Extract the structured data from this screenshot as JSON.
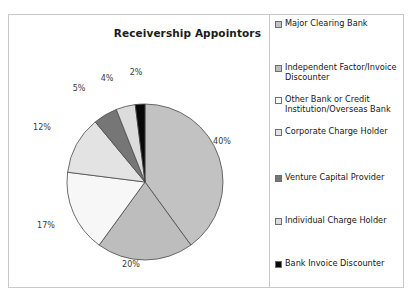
{
  "chart_data": {
    "type": "pie",
    "title": "Receivership Appointors",
    "categories": [
      "Major Clearing Bank",
      "Independent Factor/Invoice Discounter",
      "Other Bank or Credit Institution/Overseas Bank",
      "Corporate Charge Holder",
      "Venture Capital Provider",
      "Individual Charge Holder",
      "Bank Invoice Discounter"
    ],
    "values": [
      40,
      20,
      17,
      12,
      5,
      4,
      2
    ],
    "value_labels": [
      "40%",
      "20%",
      "17%",
      "12%",
      "5%",
      "4%",
      "2%"
    ],
    "colors": [
      "#c2c2c2",
      "#bdbdbd",
      "#f7f7f7",
      "#e3e3e3",
      "#767676",
      "#dcdcdc",
      "#080808"
    ],
    "slice_edge_color": "#4a4a4a",
    "start_angle_deg": 0,
    "direction": "clockwise",
    "legend_position": "right",
    "grid": false,
    "xlabel": "",
    "ylabel": ""
  },
  "legend": {
    "entries": [
      {
        "label": "Major Clearing Bank",
        "swatch": "#c2c2c2",
        "top": 4
      },
      {
        "label": "Independent Factor/Invoice Discounter",
        "swatch": "#bdbdbd",
        "top": 48
      },
      {
        "label": "Other Bank or Credit Institution/Overseas Bank",
        "swatch": "#f7f7f7",
        "top": 80
      },
      {
        "label": "Corporate Charge Holder",
        "swatch": "#e3e3e3",
        "top": 112
      },
      {
        "label": "Venture Capital Provider",
        "swatch": "#767676",
        "top": 158
      },
      {
        "label": "Individual Charge Holder",
        "swatch": "#dcdcdc",
        "top": 201
      },
      {
        "label": "Bank Invoice Discounter",
        "swatch": "#080808",
        "top": 244
      }
    ]
  },
  "slice_label_positions": [
    {
      "text": "40%",
      "x": 213,
      "y": 126
    },
    {
      "text": "20%",
      "x": 122,
      "y": 249
    },
    {
      "text": "17%",
      "x": 37,
      "y": 210
    },
    {
      "text": "12%",
      "x": 33,
      "y": 112
    },
    {
      "text": "5%",
      "x": 70,
      "y": 73
    },
    {
      "text": "4%",
      "x": 98,
      "y": 63
    },
    {
      "text": "2%",
      "x": 127,
      "y": 57
    }
  ]
}
